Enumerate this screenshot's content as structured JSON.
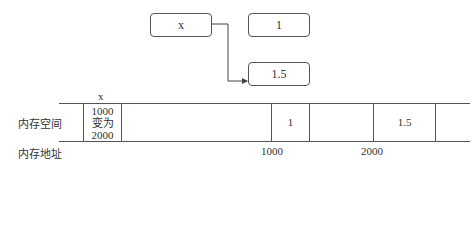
{
  "diagram": {
    "variable_box": "x",
    "value_box_old": "1",
    "value_box_new": "1.5",
    "arrow": {
      "from": "x",
      "to": "1.5"
    }
  },
  "memory": {
    "row_label": "内存空间",
    "address_label": "内存地址",
    "variable_name": "x",
    "cells": [
      {
        "text_lines": [
          "1000",
          "变为",
          "2000"
        ]
      },
      {
        "text": ""
      },
      {
        "text": "1"
      },
      {
        "text": ""
      },
      {
        "text": "1.5"
      }
    ],
    "addresses": [
      "1000",
      "2000"
    ]
  }
}
